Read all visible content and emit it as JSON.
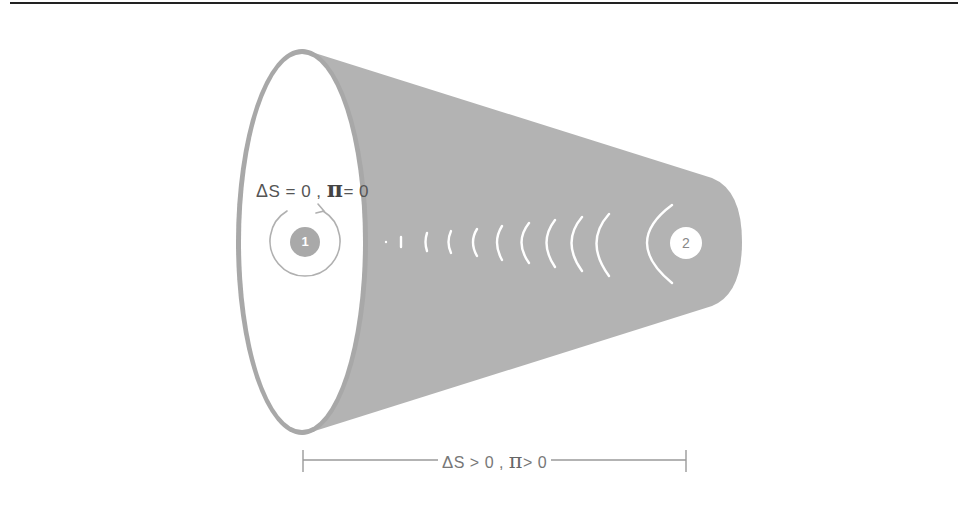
{
  "diagram": {
    "state_1": {
      "number": "1",
      "label_delta": "Δ",
      "label_s": "S = 0 , ",
      "label_pi": "π",
      "label_rest": "= 0"
    },
    "state_2": {
      "number": "2"
    },
    "span": {
      "label_delta": "Δ",
      "label_s": "S > 0 , ",
      "label_pi": "π",
      "label_rest": "> 0"
    },
    "colors": {
      "cone_fill": "#b3b3b3",
      "ellipse_rim": "#a6a6a6",
      "inner_face": "#ffffff",
      "wave_arcs": "#ffffff",
      "rotation_arrow": "#b0b0b0",
      "bracket": "#9a9a9a",
      "top_rule": "#222222"
    },
    "wave_arc_count": 10
  }
}
